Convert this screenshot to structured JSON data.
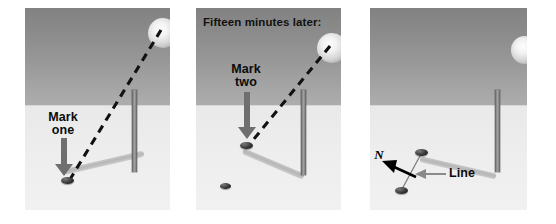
{
  "figure": {
    "background_color": "#ffffff",
    "panel_count": 3
  },
  "colors": {
    "sky_top": "#828282",
    "sky_bottom": "#adadad",
    "ground_top": "#e9e9e9",
    "ground_bottom": "#f1f1f1",
    "pole": "#7b7b7b",
    "shadow": "#bdbdbd",
    "pebble": "#1d1d1d",
    "arrow_gray": "#6f6f6f",
    "arrow_black": "#000000",
    "text": "#0b0b0b"
  },
  "panels": [
    {
      "id": "panel-one",
      "caption": "",
      "label_text": "Mark\none",
      "label_name": "mark-one-label",
      "arrow_name": "mark-one-arrow",
      "sun_name": "sun-icon",
      "pole_name": "gnomon-pole",
      "shadow_name": "pole-shadow",
      "pebble_names": [
        "pebble-mark-one"
      ],
      "ray_name": "sun-ray-dashed-line"
    },
    {
      "id": "panel-two",
      "caption": "Fifteen minutes later:",
      "label_text": "Mark\ntwo",
      "label_name": "mark-two-label",
      "arrow_name": "mark-two-arrow",
      "sun_name": "sun-icon",
      "pole_name": "gnomon-pole",
      "shadow_name": "pole-shadow",
      "pebble_names": [
        "pebble-mark-two",
        "pebble-mark-one"
      ],
      "ray_name": "sun-ray-dashed-line"
    },
    {
      "id": "panel-three",
      "caption": "",
      "north_label": "N",
      "line_label": "Line",
      "north_label_name": "north-direction-label",
      "line_label_name": "line-label",
      "north_arrow_name": "north-arrow",
      "line_arrow_name": "line-pointer-arrow",
      "sun_name": "sun-icon",
      "pole_name": "gnomon-pole",
      "shadow_name": "pole-shadow",
      "pebble_names": [
        "pebble-mark-two",
        "pebble-mark-one"
      ],
      "connector_name": "marker-connecting-line"
    }
  ]
}
